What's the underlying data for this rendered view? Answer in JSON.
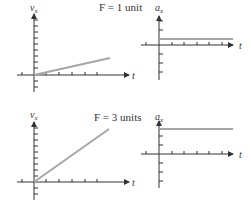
{
  "diagram": {
    "panels": [
      {
        "force_label": "F = 1 unit",
        "velocity_graph": {
          "y_label": "v",
          "y_sub": "x",
          "x_label": "t",
          "description": "velocity increases linearly with small slope"
        },
        "acceleration_graph": {
          "y_label": "a",
          "y_sub": "x",
          "x_label": "t",
          "description": "constant small acceleration"
        }
      },
      {
        "force_label": "F = 3 units",
        "velocity_graph": {
          "y_label": "v",
          "y_sub": "x",
          "x_label": "t",
          "description": "velocity increases linearly with steep slope"
        },
        "acceleration_graph": {
          "y_label": "a",
          "y_sub": "x",
          "x_label": "t",
          "description": "constant larger acceleration"
        }
      }
    ],
    "colors": {
      "axis": "#333333",
      "data_line": "#a6a6a6"
    }
  }
}
